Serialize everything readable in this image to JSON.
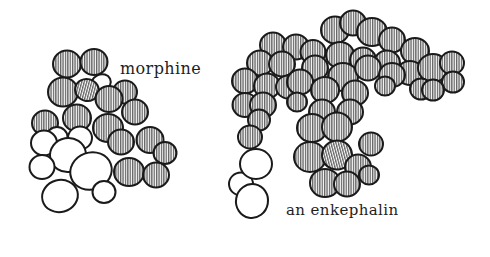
{
  "figure": {
    "paper_color": "#ffffff",
    "ink_color": "#1a1a1a",
    "hatch_style": "vertical-stripes",
    "molecules": [
      {
        "id": "morphine",
        "label": "morphine",
        "label_x": 120,
        "label_y": 59,
        "atoms": [
          {
            "x": 67,
            "y": 64,
            "rx": 14,
            "ry": 13.5,
            "rot": 0,
            "hatched": true
          },
          {
            "x": 94,
            "y": 62,
            "rx": 13.5,
            "ry": 13,
            "rot": 0,
            "hatched": true
          },
          {
            "x": 101,
            "y": 83,
            "rx": 10,
            "ry": 8.5,
            "rot": -25,
            "hatched": false
          },
          {
            "x": 63,
            "y": 92,
            "rx": 15,
            "ry": 14.5,
            "rot": 0,
            "hatched": true
          },
          {
            "x": 87,
            "y": 90,
            "rx": 12,
            "ry": 11,
            "rot": 15,
            "hatched": true
          },
          {
            "x": 125,
            "y": 92,
            "rx": 12,
            "ry": 11.5,
            "rot": 0,
            "hatched": true
          },
          {
            "x": 109,
            "y": 99,
            "rx": 13.5,
            "ry": 13,
            "rot": 0,
            "hatched": true
          },
          {
            "x": 45,
            "y": 123,
            "rx": 13,
            "ry": 12.5,
            "rot": 0,
            "hatched": true
          },
          {
            "x": 77,
            "y": 118,
            "rx": 14,
            "ry": 13.5,
            "rot": 0,
            "hatched": true
          },
          {
            "x": 135,
            "y": 112,
            "rx": 13,
            "ry": 12.5,
            "rot": 0,
            "hatched": true
          },
          {
            "x": 108,
            "y": 128,
            "rx": 15,
            "ry": 14,
            "rot": 0,
            "hatched": true
          },
          {
            "x": 121,
            "y": 142,
            "rx": 13,
            "ry": 12.5,
            "rot": 0,
            "hatched": true
          },
          {
            "x": 150,
            "y": 140,
            "rx": 13.5,
            "ry": 13,
            "rot": 0,
            "hatched": true
          },
          {
            "x": 165,
            "y": 153,
            "rx": 11.5,
            "ry": 11,
            "rot": 0,
            "hatched": true
          },
          {
            "x": 129,
            "y": 172,
            "rx": 15,
            "ry": 14,
            "rot": 0,
            "hatched": true
          },
          {
            "x": 156,
            "y": 175,
            "rx": 13,
            "ry": 12.5,
            "rot": 0,
            "hatched": true
          },
          {
            "x": 80,
            "y": 138,
            "rx": 12,
            "ry": 11.5,
            "rot": 0,
            "hatched": false
          },
          {
            "x": 57,
            "y": 137,
            "rx": 10.5,
            "ry": 10,
            "rot": 0,
            "hatched": false
          },
          {
            "x": 44,
            "y": 143,
            "rx": 13,
            "ry": 12.5,
            "rot": 0,
            "hatched": false
          },
          {
            "x": 68,
            "y": 155,
            "rx": 18,
            "ry": 17,
            "rot": -10,
            "hatched": false
          },
          {
            "x": 42,
            "y": 167,
            "rx": 12.5,
            "ry": 12,
            "rot": 0,
            "hatched": false
          },
          {
            "x": 91,
            "y": 171,
            "rx": 21,
            "ry": 18.5,
            "rot": -20,
            "hatched": false
          },
          {
            "x": 104,
            "y": 192,
            "rx": 11.5,
            "ry": 11,
            "rot": 0,
            "hatched": false
          },
          {
            "x": 60,
            "y": 196,
            "rx": 18,
            "ry": 16,
            "rot": -15,
            "hatched": false
          }
        ]
      },
      {
        "id": "enkephalin",
        "label": "an enkephalin",
        "label_x": 286,
        "label_y": 201,
        "atoms": [
          {
            "x": 335,
            "y": 30,
            "rx": 14,
            "ry": 13.5,
            "rot": 0,
            "hatched": true
          },
          {
            "x": 353,
            "y": 23,
            "rx": 13,
            "ry": 12.5,
            "rot": 0,
            "hatched": true
          },
          {
            "x": 372,
            "y": 32,
            "rx": 15,
            "ry": 14,
            "rot": 0,
            "hatched": true
          },
          {
            "x": 392,
            "y": 40,
            "rx": 13,
            "ry": 12.5,
            "rot": 0,
            "hatched": true
          },
          {
            "x": 415,
            "y": 51,
            "rx": 14,
            "ry": 13,
            "rot": 0,
            "hatched": true
          },
          {
            "x": 273,
            "y": 45,
            "rx": 13,
            "ry": 12.5,
            "rot": 0,
            "hatched": true
          },
          {
            "x": 296,
            "y": 47,
            "rx": 13,
            "ry": 12.5,
            "rot": 0,
            "hatched": true
          },
          {
            "x": 313,
            "y": 52,
            "rx": 12.5,
            "ry": 12,
            "rot": 0,
            "hatched": true
          },
          {
            "x": 340,
            "y": 55,
            "rx": 14,
            "ry": 13,
            "rot": 0,
            "hatched": true
          },
          {
            "x": 363,
            "y": 60,
            "rx": 13,
            "ry": 12.5,
            "rot": 0,
            "hatched": true
          },
          {
            "x": 387,
            "y": 63,
            "rx": 13,
            "ry": 12.5,
            "rot": 0,
            "hatched": true
          },
          {
            "x": 410,
            "y": 73,
            "rx": 13,
            "ry": 12,
            "rot": 0,
            "hatched": true
          },
          {
            "x": 433,
            "y": 68,
            "rx": 15,
            "ry": 14,
            "rot": 0,
            "hatched": true
          },
          {
            "x": 452,
            "y": 63,
            "rx": 12,
            "ry": 11.5,
            "rot": 0,
            "hatched": true
          },
          {
            "x": 453,
            "y": 82,
            "rx": 11,
            "ry": 10.5,
            "rot": 0,
            "hatched": true
          },
          {
            "x": 421,
            "y": 89,
            "rx": 11,
            "ry": 10.5,
            "rot": 0,
            "hatched": true
          },
          {
            "x": 433,
            "y": 90,
            "rx": 11,
            "ry": 10.5,
            "rot": 0,
            "hatched": true
          },
          {
            "x": 260,
            "y": 63,
            "rx": 13,
            "ry": 12.5,
            "rot": 0,
            "hatched": true
          },
          {
            "x": 282,
            "y": 64,
            "rx": 13,
            "ry": 12.5,
            "rot": 0,
            "hatched": true
          },
          {
            "x": 245,
            "y": 81,
            "rx": 13,
            "ry": 12.5,
            "rot": 0,
            "hatched": true
          },
          {
            "x": 267,
            "y": 86,
            "rx": 13,
            "ry": 12.5,
            "rot": 0,
            "hatched": true
          },
          {
            "x": 288,
            "y": 87,
            "rx": 12,
            "ry": 11.5,
            "rot": 0,
            "hatched": true
          },
          {
            "x": 315,
            "y": 68,
            "rx": 13,
            "ry": 12.5,
            "rot": 0,
            "hatched": true
          },
          {
            "x": 343,
            "y": 77,
            "rx": 15,
            "ry": 14,
            "rot": 0,
            "hatched": true
          },
          {
            "x": 368,
            "y": 68,
            "rx": 13,
            "ry": 12.5,
            "rot": 0,
            "hatched": true
          },
          {
            "x": 392,
            "y": 75,
            "rx": 13,
            "ry": 12,
            "rot": 0,
            "hatched": true
          },
          {
            "x": 385,
            "y": 86,
            "rx": 10,
            "ry": 9.5,
            "rot": 0,
            "hatched": true
          },
          {
            "x": 300,
            "y": 82,
            "rx": 13,
            "ry": 12.5,
            "rot": 0,
            "hatched": true
          },
          {
            "x": 325,
            "y": 90,
            "rx": 14,
            "ry": 13,
            "rot": 0,
            "hatched": true
          },
          {
            "x": 355,
            "y": 93,
            "rx": 13,
            "ry": 12.5,
            "rot": 0,
            "hatched": true
          },
          {
            "x": 245,
            "y": 105,
            "rx": 12.5,
            "ry": 12,
            "rot": 0,
            "hatched": true
          },
          {
            "x": 263,
            "y": 105,
            "rx": 13,
            "ry": 12.5,
            "rot": 0,
            "hatched": true
          },
          {
            "x": 297,
            "y": 102,
            "rx": 10,
            "ry": 9.5,
            "rot": 0,
            "hatched": true
          },
          {
            "x": 259,
            "y": 120,
            "rx": 11,
            "ry": 10.5,
            "rot": 0,
            "hatched": true
          },
          {
            "x": 250,
            "y": 137,
            "rx": 12,
            "ry": 11.5,
            "rot": 0,
            "hatched": true
          },
          {
            "x": 322,
            "y": 112,
            "rx": 13,
            "ry": 12.5,
            "rot": 0,
            "hatched": true
          },
          {
            "x": 350,
            "y": 112,
            "rx": 13,
            "ry": 12.5,
            "rot": 0,
            "hatched": true
          },
          {
            "x": 312,
            "y": 128,
            "rx": 15,
            "ry": 14,
            "rot": 0,
            "hatched": true
          },
          {
            "x": 337,
            "y": 127,
            "rx": 15,
            "ry": 14.5,
            "rot": 0,
            "hatched": true
          },
          {
            "x": 371,
            "y": 144,
            "rx": 12,
            "ry": 11.5,
            "rot": 0,
            "hatched": true
          },
          {
            "x": 310,
            "y": 157,
            "rx": 16,
            "ry": 15,
            "rot": 0,
            "hatched": true
          },
          {
            "x": 337,
            "y": 155,
            "rx": 15,
            "ry": 14.5,
            "rot": -15,
            "hatched": true
          },
          {
            "x": 358,
            "y": 167,
            "rx": 13,
            "ry": 12.5,
            "rot": 0,
            "hatched": true
          },
          {
            "x": 369,
            "y": 175,
            "rx": 10,
            "ry": 9.5,
            "rot": 0,
            "hatched": true
          },
          {
            "x": 325,
            "y": 183,
            "rx": 15,
            "ry": 14,
            "rot": 0,
            "hatched": true
          },
          {
            "x": 347,
            "y": 184,
            "rx": 13,
            "ry": 12.5,
            "rot": 0,
            "hatched": true
          },
          {
            "x": 241,
            "y": 184,
            "rx": 12,
            "ry": 11.5,
            "rot": 0,
            "hatched": false
          },
          {
            "x": 256,
            "y": 164,
            "rx": 16,
            "ry": 15,
            "rot": 0,
            "hatched": false
          },
          {
            "x": 252,
            "y": 201,
            "rx": 16,
            "ry": 17,
            "rot": 10,
            "hatched": false
          }
        ]
      }
    ]
  }
}
